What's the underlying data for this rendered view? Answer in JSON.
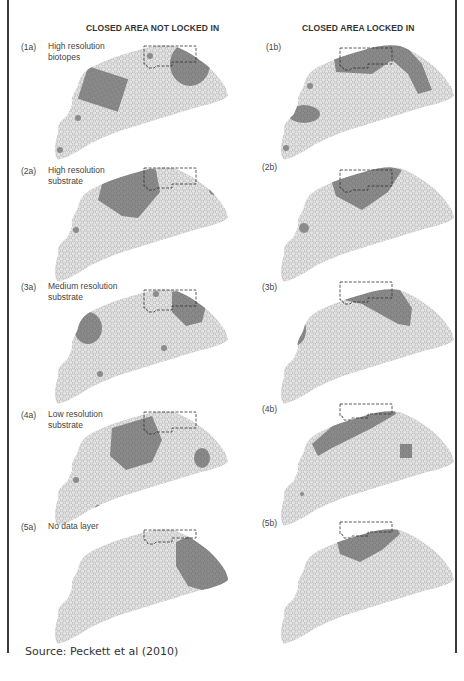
{
  "columns": {
    "left_title": "CLOSED AREA NOT LOCKED IN",
    "right_title": "CLOSED AREA LOCKED IN"
  },
  "panels": [
    {
      "id": "(1a)",
      "desc_line1": "High resolution",
      "desc_line2": "biotopes"
    },
    {
      "id": "(1b)"
    },
    {
      "id": "(2a)",
      "desc_line1": "High resolution",
      "desc_line2": "substrate"
    },
    {
      "id": "(2b)"
    },
    {
      "id": "(3a)",
      "desc_line1": "Medium resolution",
      "desc_line2": "substrate"
    },
    {
      "id": "(3b)"
    },
    {
      "id": "(4a)",
      "desc_line1": "Low resolution",
      "desc_line2": "substrate"
    },
    {
      "id": "(4b)"
    },
    {
      "id": "(5a)",
      "desc_line1": "No data layer",
      "desc_line2": ""
    },
    {
      "id": "(5b)"
    }
  ],
  "source": "Source: Peckett et al (2010)",
  "colors": {
    "frame": "#3a3a3a",
    "hex_fill": "#e6e6e6",
    "hex_stroke": "#9a9a9a",
    "selected_fill": "#8c8c8c",
    "closed_area_outline": "#333333"
  }
}
